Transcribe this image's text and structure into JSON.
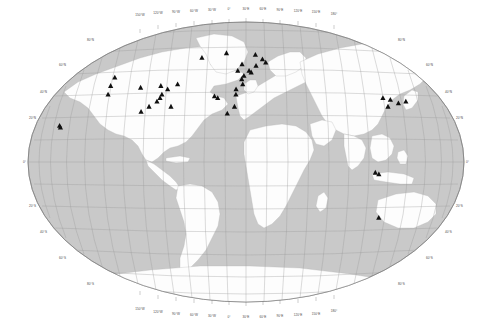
{
  "figure": {
    "type": "world-map",
    "projection": "robinson",
    "title": "",
    "background_color": "#ffffff",
    "ocean_color": "#c9c9c9",
    "land_color": "#fdfdfd",
    "graticule_color": "#9a9a9a",
    "marker_color": "#101010",
    "marker_shape": "triangle"
  },
  "axes": {
    "longitude_labels": [
      "150°W",
      "120°W",
      "90°W",
      "60°W",
      "30°W",
      "0°",
      "30°E",
      "60°E",
      "90°E",
      "120°E",
      "150°E",
      "180°"
    ],
    "longitude_values": [
      -150,
      -120,
      -90,
      -60,
      -30,
      0,
      30,
      60,
      90,
      120,
      150,
      180
    ],
    "latitude_labels_left": [
      "80°N",
      "60°N",
      "40°N",
      "20°N",
      "0°",
      "20°S",
      "40°S",
      "60°S",
      "80°S"
    ],
    "latitude_labels_right": [
      "80°N",
      "60°N",
      "40°N",
      "20°N",
      "0°",
      "20°S",
      "40°S",
      "60°S",
      "80°S"
    ],
    "latitude_values": [
      80,
      60,
      40,
      20,
      0,
      -20,
      -40,
      -60,
      -80
    ],
    "graticule_spacing_degrees": 15
  },
  "chart_data": {
    "type": "scatter",
    "title": "",
    "xlabel": "Longitude",
    "ylabel": "Latitude",
    "xlim": [
      -180,
      180
    ],
    "ylim": [
      -90,
      90
    ],
    "grid": true,
    "legend": "none",
    "marker_count": 42,
    "points": [
      {
        "name": "southern-greenland",
        "lon": -46,
        "lat": 61
      },
      {
        "name": "british-columbia",
        "lon": -124,
        "lat": 49
      },
      {
        "name": "oregon-coast",
        "lon": -124,
        "lat": 44
      },
      {
        "name": "northern-california",
        "lon": -123,
        "lat": 39
      },
      {
        "name": "central-us",
        "lon": -96,
        "lat": 43
      },
      {
        "name": "great-lakes",
        "lon": -78,
        "lat": 44
      },
      {
        "name": "nova-scotia",
        "lon": -63,
        "lat": 45
      },
      {
        "name": "new-england",
        "lon": -71,
        "lat": 42
      },
      {
        "name": "mid-atlantic-us",
        "lon": -75,
        "lat": 39
      },
      {
        "name": "chesapeake",
        "lon": -76,
        "lat": 37
      },
      {
        "name": "carolina-coast",
        "lon": -78,
        "lat": 35
      },
      {
        "name": "southeast-us",
        "lon": -84,
        "lat": 32
      },
      {
        "name": "gulf-coast",
        "lon": -90,
        "lat": 29
      },
      {
        "name": "hawaii-a",
        "lon": -157,
        "lat": 21
      },
      {
        "name": "hawaii-b",
        "lon": -156,
        "lat": 20
      },
      {
        "name": "iceland",
        "lon": -21,
        "lat": 64
      },
      {
        "name": "norway-north",
        "lon": 10,
        "lat": 63
      },
      {
        "name": "sweden",
        "lon": 17,
        "lat": 60
      },
      {
        "name": "baltic",
        "lon": 20,
        "lat": 58
      },
      {
        "name": "scotland",
        "lon": -4,
        "lat": 57
      },
      {
        "name": "denmark",
        "lon": 10,
        "lat": 56
      },
      {
        "name": "ireland",
        "lon": -8,
        "lat": 53
      },
      {
        "name": "north-sea",
        "lon": 3,
        "lat": 53
      },
      {
        "name": "netherlands",
        "lon": 5,
        "lat": 52
      },
      {
        "name": "english-channel",
        "lon": -2,
        "lat": 50
      },
      {
        "name": "brittany",
        "lon": -4,
        "lat": 48
      },
      {
        "name": "bay-of-biscay",
        "lon": -3,
        "lat": 45
      },
      {
        "name": "western-iberia",
        "lon": -9,
        "lat": 42
      },
      {
        "name": "portugal",
        "lon": -9,
        "lat": 39
      },
      {
        "name": "canary-islands",
        "lon": -16,
        "lat": 28
      },
      {
        "name": "azores",
        "lon": -28,
        "lat": 38
      },
      {
        "name": "morocco-coast",
        "lon": -10,
        "lat": 32
      },
      {
        "name": "yellow-sea",
        "lon": 121,
        "lat": 37
      },
      {
        "name": "korea",
        "lon": 127,
        "lat": 36
      },
      {
        "name": "east-china-sea",
        "lon": 123,
        "lat": 32
      },
      {
        "name": "japan-south",
        "lon": 133,
        "lat": 34
      },
      {
        "name": "japan-pacific",
        "lon": 140,
        "lat": 35
      },
      {
        "name": "java-sea",
        "lon": 107,
        "lat": -6
      },
      {
        "name": "indonesia",
        "lon": 110,
        "lat": -7
      },
      {
        "name": "southwest-australia",
        "lon": 115,
        "lat": -32
      },
      {
        "name": "mid-atlantic",
        "lon": -25,
        "lat": 37
      },
      {
        "name": "bermuda",
        "lon": -65,
        "lat": 32
      }
    ]
  }
}
